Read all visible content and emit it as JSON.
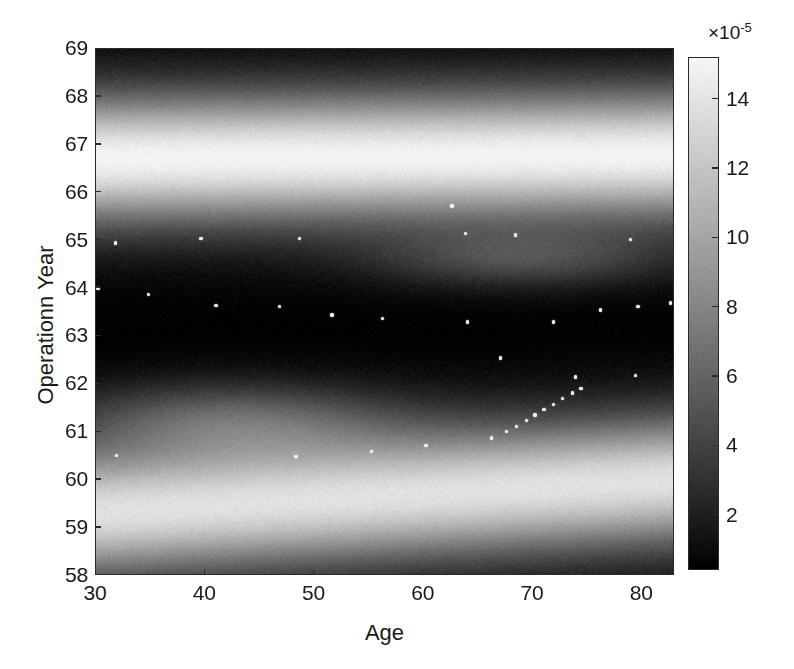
{
  "chart_data": {
    "type": "heatmap",
    "title": "",
    "xlabel": "Age",
    "ylabel": "Operationn Year",
    "xlim": [
      30,
      83
    ],
    "ylim": [
      58,
      69
    ],
    "xticks": [
      30,
      40,
      50,
      60,
      70,
      80
    ],
    "yticks": [
      58,
      59,
      60,
      61,
      62,
      63,
      64,
      65,
      66,
      67,
      68,
      69
    ],
    "grid": false,
    "legend": null,
    "colormap": "gray",
    "colorbar": {
      "ticks": [
        2,
        4,
        6,
        8,
        10,
        12,
        14
      ],
      "exponent_label": "×10",
      "exponent_value": "-5",
      "range": [
        0.4,
        15.2
      ],
      "orientation": "vertical",
      "position": "right"
    },
    "density_bands": [
      {
        "center_y": 66.75,
        "sigma": 0.95,
        "peak": 14.6,
        "note": "dominant bright horizontal band"
      },
      {
        "center_y": 59.3,
        "sigma": 0.95,
        "peak": 13.4,
        "note": "lower bright band, slopes up slightly to the right"
      },
      {
        "center_y": 61.25,
        "sigma": 0.55,
        "peak": 4.6,
        "note": "faint glow, Age 32-53"
      },
      {
        "center_y": 64.6,
        "sigma": 0.42,
        "peak": 3.6,
        "note": "faint glow, Age 55-80"
      }
    ],
    "scatter_points": [
      [
        31.8,
        64.95
      ],
      [
        39.6,
        65.05
      ],
      [
        48.6,
        65.05
      ],
      [
        63.8,
        65.15
      ],
      [
        68.4,
        65.12
      ],
      [
        78.9,
        65.02
      ],
      [
        30.2,
        64.0
      ],
      [
        34.8,
        63.88
      ],
      [
        41.0,
        63.65
      ],
      [
        46.8,
        63.62
      ],
      [
        51.6,
        63.45
      ],
      [
        56.2,
        63.38
      ],
      [
        64.0,
        63.3
      ],
      [
        71.9,
        63.3
      ],
      [
        76.2,
        63.55
      ],
      [
        79.6,
        63.62
      ],
      [
        82.6,
        63.7
      ],
      [
        67.0,
        62.55
      ],
      [
        73.9,
        62.15
      ],
      [
        79.4,
        62.18
      ],
      [
        31.9,
        60.52
      ],
      [
        48.3,
        60.5
      ],
      [
        55.2,
        60.6
      ],
      [
        60.2,
        60.72
      ],
      [
        66.2,
        60.88
      ],
      [
        67.6,
        61.02
      ],
      [
        68.5,
        61.12
      ],
      [
        69.4,
        61.25
      ],
      [
        70.2,
        61.36
      ],
      [
        71.0,
        61.47
      ],
      [
        71.9,
        61.58
      ],
      [
        72.7,
        61.7
      ],
      [
        73.6,
        61.82
      ],
      [
        74.4,
        61.92
      ],
      [
        62.6,
        65.72
      ]
    ]
  },
  "axes": {
    "x_tick_labels": [
      "30",
      "40",
      "50",
      "60",
      "70",
      "80"
    ],
    "y_tick_labels": [
      "58",
      "59",
      "60",
      "61",
      "62",
      "63",
      "64",
      "65",
      "66",
      "67",
      "68",
      "69"
    ],
    "colorbar_tick_labels": [
      "2",
      "4",
      "6",
      "8",
      "10",
      "12",
      "14"
    ]
  }
}
